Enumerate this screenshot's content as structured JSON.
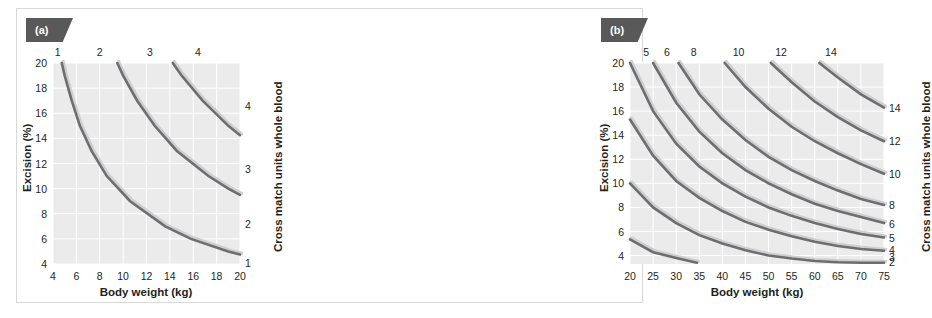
{
  "figure": {
    "background": "#ffffff",
    "frame_color": "#d8d8d8",
    "plot_background": "#ebebeb",
    "grid_color": "#ffffff",
    "curve_color": "#6d6e71",
    "badge_color": "#595959"
  },
  "panels": {
    "a": {
      "badge": "(a)",
      "xlabel": "Body weight (kg)",
      "ylabel": "Excision (%)",
      "rlabel": "Cross match units whole blood",
      "xticks": [
        4,
        6,
        8,
        10,
        12,
        14,
        16,
        18,
        20
      ],
      "yticks": [
        4,
        6,
        8,
        10,
        12,
        14,
        16,
        18,
        20
      ],
      "top_labels": [
        1,
        2,
        3,
        4
      ],
      "right_labels": [
        4,
        3,
        2,
        1
      ]
    },
    "b": {
      "badge": "(b)",
      "xlabel": "Body weight (kg)",
      "ylabel": "Excision (%)",
      "rlabel": "Cross match units whole blood",
      "xticks": [
        20,
        25,
        30,
        35,
        40,
        45,
        50,
        55,
        60,
        65,
        70,
        75
      ],
      "yticks": [
        4,
        6,
        8,
        10,
        12,
        14,
        16,
        18,
        20
      ],
      "top_labels": [
        5,
        6,
        8,
        10,
        12,
        14
      ],
      "right_labels": [
        14,
        12,
        10,
        8,
        6,
        5,
        4,
        3,
        2
      ]
    }
  },
  "chart_data": [
    {
      "type": "line",
      "panel": "(a)",
      "title": "",
      "xlabel": "Body weight (kg)",
      "ylabel": "Excision (%)",
      "y2label": "Cross match units whole blood",
      "xlim": [
        4,
        20
      ],
      "ylim": [
        4,
        20
      ],
      "grid": true,
      "legend": "none",
      "note": "Iso-blood-loss hyperbolae: excision(%) x body weight(kg) = constant. Each curve marks the boundary where an additional cross-match unit of whole blood is required. Top-edge numbers and right-edge numbers give the number of units.",
      "top_axis_labels": [
        {
          "label": "1",
          "x": 4.4
        },
        {
          "label": "2",
          "x": 8.0
        },
        {
          "label": "3",
          "x": 12.3
        },
        {
          "label": "4",
          "x": 16.4
        }
      ],
      "right_axis_labels": [
        {
          "label": "4",
          "y": 16.6
        },
        {
          "label": "3",
          "y": 11.6
        },
        {
          "label": "2",
          "y": 7.2
        },
        {
          "label": "1",
          "y": 4.1
        }
      ],
      "series": [
        {
          "name": "1 unit boundary",
          "constant": 95,
          "points": [
            [
              4.75,
              20
            ],
            [
              5,
              19
            ],
            [
              5.6,
              17
            ],
            [
              6.3,
              15
            ],
            [
              7.3,
              13
            ],
            [
              8.6,
              11
            ],
            [
              10.6,
              9
            ],
            [
              13.6,
              7
            ],
            [
              15.8,
              6
            ],
            [
              19.0,
              5
            ],
            [
              20,
              4.75
            ]
          ]
        },
        {
          "name": "2 unit boundary",
          "constant": 190,
          "points": [
            [
              9.5,
              20
            ],
            [
              10,
              19
            ],
            [
              11.2,
              17
            ],
            [
              12.7,
              15
            ],
            [
              14.6,
              13
            ],
            [
              17.3,
              11
            ],
            [
              19.0,
              10
            ],
            [
              20,
              9.5
            ]
          ]
        },
        {
          "name": "3 unit boundary",
          "constant": 285,
          "points": [
            [
              14.25,
              20
            ],
            [
              15,
              19
            ],
            [
              16.8,
              17
            ],
            [
              19.0,
              15
            ],
            [
              20,
              14.25
            ]
          ]
        }
      ]
    },
    {
      "type": "line",
      "panel": "(b)",
      "title": "",
      "xlabel": "Body weight (kg)",
      "ylabel": "Excision (%)",
      "y2label": "Cross match units whole blood",
      "xlim": [
        20,
        75
      ],
      "ylim": [
        3.3,
        20
      ],
      "grid": true,
      "legend": "none",
      "note": "Iso-blood-loss hyperbolae for larger body weights: excision(%) x body weight(kg) = constant. Nine curves for 2,3,4,5,6,8,10,12 and 14 cross-match units of whole blood.",
      "top_axis_labels": [
        {
          "label": "5",
          "x": 23.5
        },
        {
          "label": "6",
          "x": 28.0
        },
        {
          "label": "8",
          "x": 33.8
        },
        {
          "label": "10",
          "x": 43.5
        },
        {
          "label": "12",
          "x": 52.7
        },
        {
          "label": "14",
          "x": 63.5
        }
      ],
      "right_axis_labels": [
        {
          "label": "14",
          "y": 16.3
        },
        {
          "label": "12",
          "y": 13.5
        },
        {
          "label": "10",
          "y": 10.8
        },
        {
          "label": "8",
          "y": 8.2
        },
        {
          "label": "6",
          "y": 6.6
        },
        {
          "label": "5",
          "y": 5.5
        },
        {
          "label": "4",
          "y": 4.5
        },
        {
          "label": "3",
          "y": 3.9
        },
        {
          "label": "2",
          "y": 3.5
        }
      ],
      "series": [
        {
          "name": "2 units",
          "constant": 107,
          "points": [
            [
              20,
              5.35
            ],
            [
              25,
              4.28
            ],
            [
              30,
              3.8
            ],
            [
              34.5,
              3.4
            ]
          ]
        },
        {
          "name": "3 units",
          "constant": 200,
          "points": [
            [
              20,
              10.0
            ],
            [
              25,
              8.0
            ],
            [
              30,
              6.7
            ],
            [
              35,
              5.7
            ],
            [
              40,
              5.0
            ],
            [
              45,
              4.45
            ],
            [
              50,
              4.0
            ],
            [
              55,
              3.75
            ],
            [
              60,
              3.55
            ],
            [
              65,
              3.45
            ],
            [
              70,
              3.4
            ],
            [
              75,
              3.4
            ]
          ]
        },
        {
          "name": "4 units",
          "constant": 307,
          "points": [
            [
              20,
              15.3
            ],
            [
              25,
              12.3
            ],
            [
              30,
              10.2
            ],
            [
              35,
              8.8
            ],
            [
              40,
              7.7
            ],
            [
              45,
              6.8
            ],
            [
              50,
              6.15
            ],
            [
              55,
              5.6
            ],
            [
              60,
              5.15
            ],
            [
              65,
              4.8
            ],
            [
              70,
              4.55
            ],
            [
              75,
              4.4
            ]
          ]
        },
        {
          "name": "5 units",
          "constant": 400,
          "points": [
            [
              20,
              20
            ],
            [
              25,
              16.0
            ],
            [
              30,
              13.3
            ],
            [
              35,
              11.4
            ],
            [
              40,
              10.0
            ],
            [
              45,
              8.9
            ],
            [
              50,
              8.0
            ],
            [
              55,
              7.3
            ],
            [
              60,
              6.7
            ],
            [
              65,
              6.2
            ],
            [
              70,
              5.8
            ],
            [
              75,
              5.5
            ]
          ]
        },
        {
          "name": "6 units",
          "constant": 500,
          "points": [
            [
              25,
              20
            ],
            [
              30,
              16.7
            ],
            [
              35,
              14.3
            ],
            [
              40,
              12.5
            ],
            [
              45,
              11.1
            ],
            [
              50,
              10.0
            ],
            [
              55,
              9.1
            ],
            [
              60,
              8.3
            ],
            [
              65,
              7.7
            ],
            [
              70,
              7.2
            ],
            [
              75,
              6.7
            ]
          ]
        },
        {
          "name": "8 units",
          "constant": 610,
          "points": [
            [
              30.5,
              20
            ],
            [
              35,
              17.4
            ],
            [
              40,
              15.3
            ],
            [
              45,
              13.6
            ],
            [
              50,
              12.2
            ],
            [
              55,
              11.1
            ],
            [
              60,
              10.2
            ],
            [
              65,
              9.4
            ],
            [
              70,
              8.7
            ],
            [
              75,
              8.2
            ]
          ]
        },
        {
          "name": "10 units",
          "constant": 810,
          "points": [
            [
              40.5,
              20
            ],
            [
              45,
              18.0
            ],
            [
              50,
              16.2
            ],
            [
              55,
              14.7
            ],
            [
              60,
              13.5
            ],
            [
              65,
              12.5
            ],
            [
              70,
              11.6
            ],
            [
              75,
              10.8
            ]
          ]
        },
        {
          "name": "12 units",
          "constant": 1010,
          "points": [
            [
              50.5,
              20
            ],
            [
              55,
              18.4
            ],
            [
              60,
              16.8
            ],
            [
              65,
              15.5
            ],
            [
              70,
              14.4
            ],
            [
              75,
              13.5
            ]
          ]
        },
        {
          "name": "14 units",
          "constant": 1220,
          "points": [
            [
              61,
              20
            ],
            [
              65,
              18.8
            ],
            [
              70,
              17.4
            ],
            [
              75,
              16.3
            ]
          ]
        }
      ]
    }
  ]
}
